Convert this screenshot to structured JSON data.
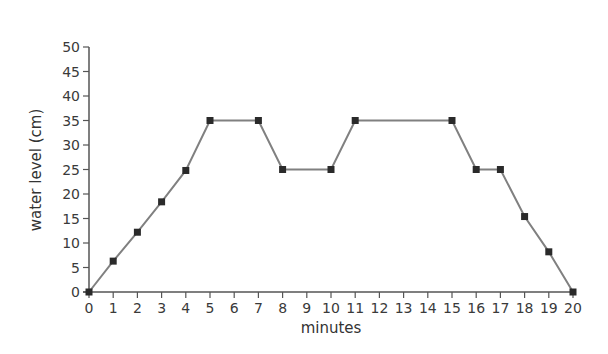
{
  "chart_data": {
    "type": "line",
    "title": "",
    "xlabel": "minutes",
    "ylabel": "water level (cm)",
    "xlim": [
      0,
      20
    ],
    "ylim": [
      0,
      50
    ],
    "x_ticks": [
      0,
      1,
      2,
      3,
      4,
      5,
      6,
      7,
      8,
      9,
      10,
      11,
      12,
      13,
      14,
      15,
      16,
      17,
      18,
      19,
      20
    ],
    "y_ticks": [
      0,
      5,
      10,
      15,
      20,
      25,
      30,
      35,
      40,
      45,
      50
    ],
    "grid": false,
    "legend": null,
    "series": [
      {
        "name": "water level",
        "color": "#808080",
        "marker_color": "#2a2a2a",
        "marker": "square",
        "points": [
          {
            "x": 0,
            "y": 0
          },
          {
            "x": 1,
            "y": 6.3
          },
          {
            "x": 2,
            "y": 12.2
          },
          {
            "x": 3,
            "y": 18.4
          },
          {
            "x": 4,
            "y": 24.8
          },
          {
            "x": 5,
            "y": 35
          },
          {
            "x": 7,
            "y": 35
          },
          {
            "x": 8,
            "y": 25
          },
          {
            "x": 10,
            "y": 25
          },
          {
            "x": 11,
            "y": 35
          },
          {
            "x": 15,
            "y": 35
          },
          {
            "x": 16,
            "y": 25
          },
          {
            "x": 17,
            "y": 25
          },
          {
            "x": 18,
            "y": 15.4
          },
          {
            "x": 19,
            "y": 8.2
          },
          {
            "x": 20,
            "y": 0
          }
        ]
      }
    ]
  }
}
